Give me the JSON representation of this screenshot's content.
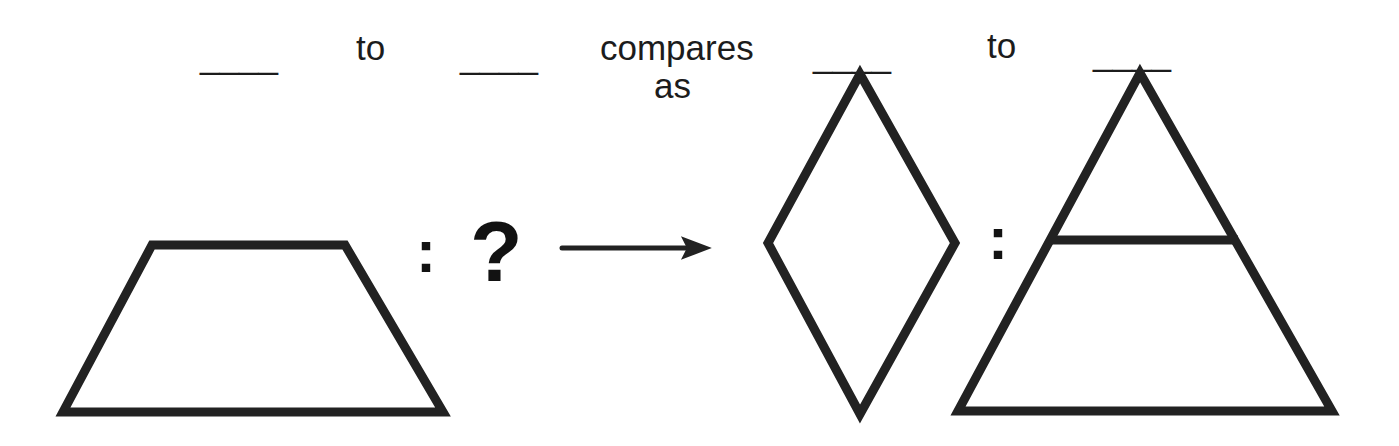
{
  "puzzle": {
    "type": "visual-analogy-question",
    "prompt": {
      "blank_1": "____",
      "word_to_1": "to",
      "blank_2": "____",
      "word_compares": "compares",
      "word_as": "as",
      "blank_3": "____",
      "word_to_2": "to",
      "blank_4": "____"
    },
    "left_pair": {
      "first_shape": "trapezoid",
      "ratio_colon": ":",
      "second_shape": "question-mark",
      "question_mark": "?"
    },
    "relation_arrow": "→",
    "right_pair": {
      "first_shape": "rhombus-diamond",
      "ratio_colon": ":",
      "second_shape": "triangle-with-horizontal-divider"
    },
    "colors": {
      "ink": "#1c1c1c",
      "stroke": "#222222",
      "background": "#ffffff"
    },
    "stroke_width": "8"
  }
}
